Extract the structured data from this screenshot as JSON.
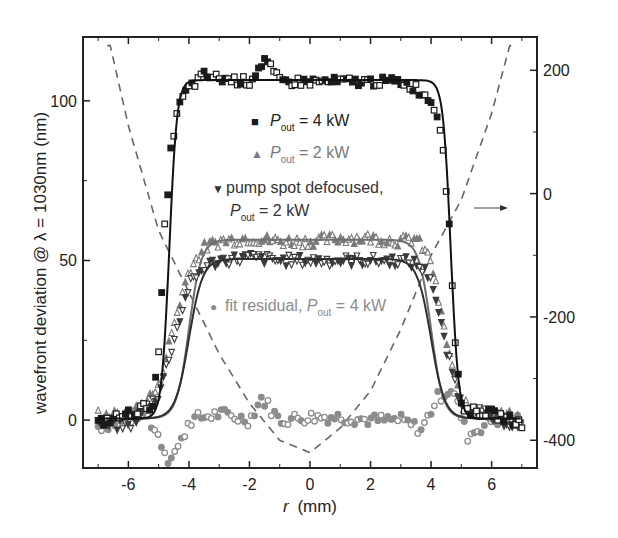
{
  "chart_data": {
    "type": "scatter",
    "title": "",
    "xlabel": "r (mm)",
    "xlabel_italic_part": "r",
    "xlabel_unit": "(mm)",
    "ylabel": "wavefront deviation @ λ = 1030nm (nm)",
    "y2label": "",
    "xlim": [
      -7.5,
      7.5
    ],
    "ylim": [
      -15,
      120
    ],
    "y2lim": [
      -445,
      254
    ],
    "xticks": [
      -6,
      -4,
      -2,
      0,
      2,
      4,
      6
    ],
    "xtick_labels": [
      "-6",
      "-4",
      "-2",
      "0",
      "2",
      "4",
      "6"
    ],
    "yticks": [
      0,
      50,
      100
    ],
    "ytick_labels": [
      "0",
      "50",
      "100"
    ],
    "y2ticks": [
      -400,
      -200,
      0,
      200
    ],
    "y2tick_labels": [
      "-400",
      "-200",
      "0",
      "200"
    ],
    "grid": false,
    "legend_position": "inside, center-top",
    "annotations": [
      {
        "type": "arrow",
        "text": "",
        "from_x": 4.6,
        "to_x": 6.2,
        "y2": -25,
        "meaning": "dashed curve refers to right axis"
      }
    ],
    "series": [
      {
        "name": "P_out = 4 kW",
        "marker": "filled-square / open-square",
        "color": "#1a1a1a",
        "axis": "left",
        "plateau": 106,
        "edge_r": 4.65,
        "edge_width": 0.28,
        "x": [
          -7,
          -6,
          -5.2,
          -5,
          -4.8,
          -4.6,
          -4.4,
          -4.2,
          -4,
          -3.5,
          -3,
          -2,
          -1.5,
          -1,
          0,
          1,
          2,
          3,
          3.5,
          4,
          4.2,
          4.4,
          4.6,
          4.8,
          5,
          5.2,
          6,
          7
        ],
        "values": [
          -1,
          2,
          5,
          20,
          60,
          84,
          96,
          101,
          104,
          108,
          107,
          106,
          113,
          106,
          106,
          106,
          106,
          106,
          104,
          100,
          96,
          86,
          60,
          25,
          5,
          3,
          2,
          -1
        ]
      },
      {
        "name": "P_out = 2 kW",
        "marker": "filled-triangle / open-triangle",
        "color": "#7a7a7a",
        "axis": "left",
        "plateau": 56,
        "edge_r": 4.0,
        "edge_width": 0.45,
        "x": [
          -7,
          -6,
          -5,
          -4.5,
          -4,
          -3.5,
          -3,
          -2,
          -1,
          0,
          1,
          2,
          3,
          3.5,
          4,
          4.5,
          5,
          6,
          7
        ],
        "values": [
          2,
          1,
          10,
          30,
          47,
          54,
          56,
          57,
          56,
          56,
          57,
          57,
          56,
          57,
          50,
          25,
          5,
          2,
          1
        ]
      },
      {
        "name": "pump spot defocused, P_out = 2 kW",
        "marker": "filled-inverted-triangle",
        "color": "#3a3a3a",
        "axis": "left",
        "plateau": 50,
        "edge_r": 4.0,
        "edge_width": 0.5,
        "x": [
          -7,
          -6,
          -5,
          -4.5,
          -4,
          -3.5,
          -3,
          -2,
          -1,
          0,
          1,
          2,
          3,
          3.5,
          4,
          4.5,
          5,
          6,
          7
        ],
        "values": [
          -1,
          -2,
          8,
          25,
          42,
          48,
          50,
          51,
          50,
          50,
          50,
          50,
          50,
          49,
          45,
          22,
          5,
          1,
          -2
        ]
      },
      {
        "name": "fit residual, P_out = 4 kW",
        "marker": "filled-circle / open-circle",
        "color": "#8c8c8c",
        "axis": "left",
        "x": [
          -7,
          -6,
          -5.5,
          -5,
          -4.7,
          -4.3,
          -4,
          -3,
          -2,
          -1.6,
          -1,
          0,
          1,
          2,
          3,
          3.7,
          4.2,
          4.7,
          5.2,
          6,
          7
        ],
        "values": [
          -2,
          0,
          3,
          -5,
          -12,
          -8,
          0,
          2,
          0,
          7,
          0,
          1,
          1,
          0,
          0,
          -3,
          7,
          10,
          -5,
          0,
          0
        ]
      },
      {
        "name": "parabolic phase (dashed)",
        "marker": "dashed-line",
        "color": "#666666",
        "axis": "right",
        "x": [
          -6.6,
          -6,
          -5,
          -4,
          -3,
          -2,
          -1,
          0,
          1,
          2,
          3,
          4,
          5,
          6,
          6.6
        ],
        "values": [
          240,
          110,
          -60,
          -160,
          -260,
          -340,
          -400,
          -420,
          -380,
          -320,
          -220,
          -100,
          -10,
          130,
          240
        ]
      }
    ]
  },
  "legend": {
    "items": [
      {
        "symbol": "■",
        "prefix": "",
        "P": "P",
        "sub": "out",
        "suffix": " = 4 kW",
        "color": "#1a1a1a"
      },
      {
        "symbol": "▲",
        "prefix": "",
        "P": "P",
        "sub": "out",
        "suffix": " = 2 kW",
        "color": "#7a7a7a"
      },
      {
        "symbol": "▼",
        "prefix": "pump spot defocused,",
        "P": "P",
        "sub": "out",
        "suffix": " = 2 kW",
        "color": "#333333"
      },
      {
        "symbol": "●",
        "prefix": "fit residual, ",
        "P": "P",
        "sub": "out",
        "suffix": " = 4 kW",
        "color": "#8c8c8c"
      }
    ]
  },
  "colors": {
    "axis": "#222222",
    "dashed_curve": "#666666",
    "series_4kw": "#1a1a1a",
    "series_2kw": "#7a7a7a",
    "series_defocused": "#3a3a3a",
    "series_residual": "#8c8c8c"
  }
}
